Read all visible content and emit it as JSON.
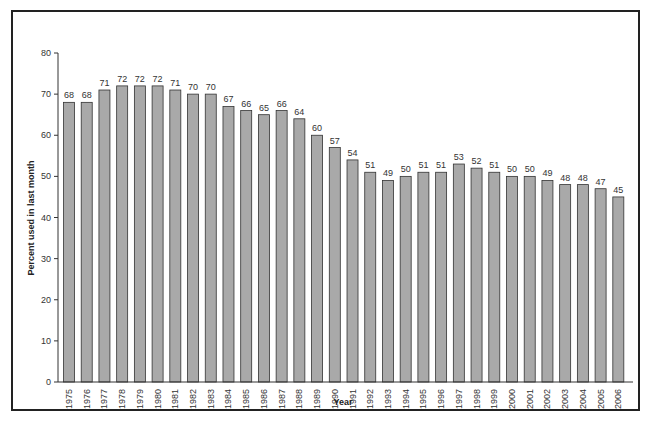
{
  "chart_data": {
    "type": "bar",
    "title": "",
    "xlabel": "Year",
    "ylabel": "Percent used in last month",
    "ylim": [
      0,
      80
    ],
    "yticks": [
      0,
      10,
      20,
      30,
      40,
      50,
      60,
      70,
      80
    ],
    "grid": false,
    "legend": null,
    "bar_color": "#a9a9a9",
    "categories": [
      "1975",
      "1976",
      "1977",
      "1978",
      "1979",
      "1980",
      "1981",
      "1982",
      "1983",
      "1984",
      "1985",
      "1986",
      "1987",
      "1988",
      "1989",
      "1990",
      "1991",
      "1992",
      "1993",
      "1994",
      "1995",
      "1996",
      "1997",
      "1998",
      "1999",
      "2000",
      "2001",
      "2002",
      "2003",
      "2004",
      "2005",
      "2006"
    ],
    "values": [
      68,
      68,
      71,
      72,
      72,
      72,
      71,
      70,
      70,
      67,
      66,
      65,
      66,
      64,
      60,
      57,
      54,
      51,
      49,
      50,
      51,
      51,
      53,
      52,
      51,
      50,
      50,
      49,
      48,
      48,
      47,
      45
    ]
  }
}
